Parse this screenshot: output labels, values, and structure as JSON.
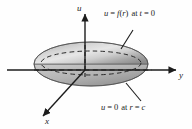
{
  "figure": {
    "name": "vibrating-circular-membrane-diagram",
    "background_color": "#fefefe",
    "ink_color": "#1c1c1c",
    "surface_light_color": "#e8e8e8",
    "surface_mid_color": "#c3c3c3",
    "surface_dark_color": "#8e8e8e"
  },
  "axes": {
    "vertical": {
      "label": "u",
      "name": "u-axis"
    },
    "horizontal_right": {
      "label": "y",
      "name": "y-axis"
    },
    "depth_front": {
      "label": "x",
      "name": "x-axis"
    }
  },
  "annotations": {
    "initial_condition": {
      "name": "initial-displacement-label",
      "lhs": "u",
      "eq1": "=",
      "fn": "f",
      "open": "(",
      "arg": "r",
      "close": ")",
      "at": "at",
      "var": "t",
      "eq2": "=",
      "value": "0",
      "full_text": "u = f(r) at t = 0"
    },
    "boundary_condition": {
      "name": "boundary-condition-label",
      "lhs": "u",
      "eq1": "=",
      "value1": "0",
      "at": "at",
      "var": "r",
      "eq2": "=",
      "value2": "c",
      "full_text": "u = 0 at r = c"
    }
  }
}
